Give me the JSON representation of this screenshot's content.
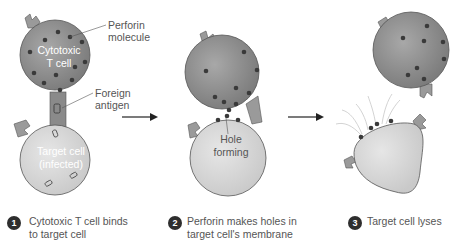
{
  "colors": {
    "tcell_fill": "#8e8e8e",
    "target_fill": "#d9d9d9",
    "perforin": "#3a3a3a",
    "receptor": "#9a9a9a",
    "text": "#555555",
    "arrow": "#222222"
  },
  "labels": {
    "perforin": [
      "Perforin",
      "molecule"
    ],
    "tcell": [
      "Cytotoxic",
      "T cell"
    ],
    "antigen": [
      "Foreign",
      "antigen"
    ],
    "target": [
      "Target cell",
      "(infected)"
    ],
    "hole": [
      "Hole",
      "forming"
    ]
  },
  "steps": [
    {
      "number": "1",
      "caption": [
        "Cytotoxic T cell binds",
        "to target cell"
      ]
    },
    {
      "number": "2",
      "caption": [
        "Perforin makes holes in",
        "target cell's membrane"
      ]
    },
    {
      "number": "3",
      "caption": [
        "Target cell lyses"
      ]
    }
  ],
  "icons": {
    "arrow": "right-arrow"
  }
}
